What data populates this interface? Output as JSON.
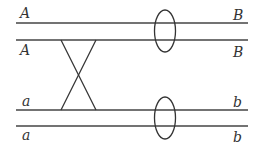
{
  "diagram": {
    "type": "chromosome crossover diagram",
    "stroke_color": "#333333",
    "labels": {
      "top_line1_left": "A",
      "top_line1_right": "B",
      "top_line2_left": "A",
      "top_line2_right": "B",
      "bottom_line1_left": "a",
      "bottom_line1_right": "b",
      "bottom_line2_left": "a",
      "bottom_line2_right": "b"
    }
  }
}
